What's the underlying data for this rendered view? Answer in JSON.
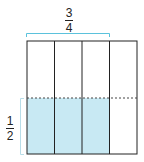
{
  "diagram": {
    "top_fraction": {
      "numerator": "3",
      "denominator": "4"
    },
    "side_fraction": {
      "numerator": "1",
      "denominator": "2"
    },
    "columns": 4,
    "shaded_columns": 3,
    "shaded_rows_fraction": "1/2",
    "colors": {
      "outline": "#222222",
      "bracket": "#5bc2dc",
      "shade": "#c8e9f3",
      "dash": "#444444"
    }
  }
}
